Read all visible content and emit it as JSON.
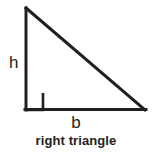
{
  "figure": {
    "caption": "right triangle",
    "background_color": "#ffffff",
    "stroke_color": "#231f20",
    "stroke_width": 3,
    "labels": {
      "height": "h",
      "base": "b"
    }
  },
  "diagram_data": {
    "type": "geometry-diagram",
    "shape": "right triangle",
    "vertices": {
      "apex": [
        26,
        7
      ],
      "right_angle_corner": [
        26,
        110
      ],
      "base_right": [
        145,
        110
      ]
    },
    "sides": [
      {
        "name": "height",
        "label": "h",
        "from": "apex",
        "to": "right_angle_corner"
      },
      {
        "name": "base",
        "label": "b",
        "from": "right_angle_corner",
        "to": "base_right"
      },
      {
        "name": "hypotenuse",
        "label": "",
        "from": "apex",
        "to": "base_right"
      }
    ],
    "right_angle_marker": {
      "at": "right_angle_corner",
      "size": 17,
      "x": 26,
      "y": 93
    }
  }
}
